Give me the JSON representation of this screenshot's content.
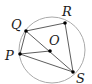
{
  "diagram": {
    "type": "circle-geometry",
    "circle": {
      "cx": 52,
      "cy": 50,
      "r": 33,
      "stroke": "#aaaaaa"
    },
    "points": [
      {
        "id": "Q",
        "label": "Q",
        "x": 26,
        "y": 31,
        "lx": 11,
        "ly": 29
      },
      {
        "id": "R",
        "label": "R",
        "x": 65,
        "y": 23,
        "lx": 62,
        "ly": 16
      },
      {
        "id": "O",
        "label": "O",
        "x": 50,
        "y": 51,
        "lx": 49,
        "ly": 45
      },
      {
        "id": "P",
        "label": "P",
        "x": 20,
        "y": 54,
        "lx": 5,
        "ly": 60
      },
      {
        "id": "S",
        "label": "S",
        "x": 73,
        "y": 72,
        "lx": 76,
        "ly": 83
      }
    ],
    "segments": [
      [
        "Q",
        "R"
      ],
      [
        "R",
        "S"
      ],
      [
        "Q",
        "P"
      ],
      [
        "Q",
        "S"
      ],
      [
        "P",
        "O"
      ],
      [
        "P",
        "S"
      ]
    ],
    "line_color": "#333333"
  }
}
